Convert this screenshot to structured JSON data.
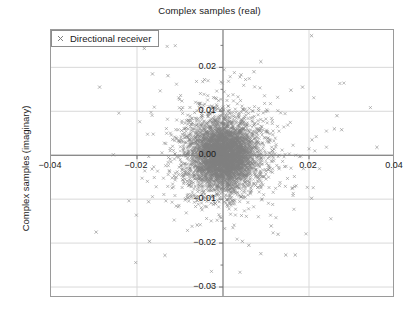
{
  "chart_data": {
    "type": "scatter",
    "title": "Complex samples (real)",
    "xlabel": "",
    "ylabel": "Complex samples (imaginary)",
    "xlim": [
      -0.04,
      0.04
    ],
    "ylim": [
      -0.0325,
      0.0285
    ],
    "grid": true,
    "xticks": [
      -0.04,
      -0.02,
      0.02,
      0.04
    ],
    "xtick_labels": [
      "−0.04",
      "−0.02",
      "0.02",
      "0.04"
    ],
    "yticks": [
      0.02,
      0.01,
      0.0,
      -0.01,
      -0.02,
      -0.03
    ],
    "ytick_labels": [
      "0.02",
      "0.01",
      "0.00",
      "−0.01",
      "−0.02",
      "−0.03"
    ],
    "legend": {
      "position": "upper left",
      "entries": [
        {
          "label": "Directional receiver",
          "marker": "x",
          "color": "#7f7f7f"
        }
      ]
    },
    "series": [
      {
        "name": "Directional receiver",
        "marker": "x",
        "color": "#808080",
        "distribution": "complex gaussian noise cloud centered at origin",
        "center": [
          0.0,
          0.0
        ],
        "sigma": 0.0042,
        "n_points": 6000,
        "outlier_points": [
          [
            -0.0183,
            0.0243
          ],
          [
            0.0206,
            0.0272
          ],
          [
            0.0088,
            0.0213
          ],
          [
            -0.0287,
            0.0155
          ],
          [
            -0.0164,
            0.0185
          ],
          [
            -0.0128,
            0.0181
          ],
          [
            0.0042,
            0.0183
          ],
          [
            0.0072,
            0.019
          ],
          [
            -0.0043,
            0.0172
          ],
          [
            0.0185,
            0.0155
          ],
          [
            0.0158,
            0.0148
          ],
          [
            0.0265,
            0.009
          ],
          [
            0.0259,
            0.006
          ],
          [
            0.0276,
            0.0058
          ],
          [
            0.0207,
            0.0035
          ],
          [
            0.0358,
            0.0018
          ],
          [
            -0.0255,
            0.0001
          ],
          [
            0.0206,
            -0.0098
          ],
          [
            -0.0173,
            -0.0106
          ],
          [
            -0.0295,
            -0.0175
          ],
          [
            -0.0171,
            -0.0196
          ],
          [
            -0.0135,
            -0.0228
          ],
          [
            0.0088,
            -0.0224
          ],
          [
            0.0146,
            -0.0227
          ],
          [
            0.0168,
            -0.0227
          ],
          [
            0.0128,
            -0.018
          ],
          [
            0.0045,
            -0.0196
          ],
          [
            -0.006,
            -0.0159
          ],
          [
            0.0112,
            -0.0161
          ],
          [
            0.006,
            -0.0205
          ]
        ]
      }
    ]
  },
  "axes": {
    "spine_color": "#9a9a9a",
    "grid_color": "#d9d9d9",
    "zero_axis_color": "#6e6e6e",
    "background": "#ffffff"
  }
}
